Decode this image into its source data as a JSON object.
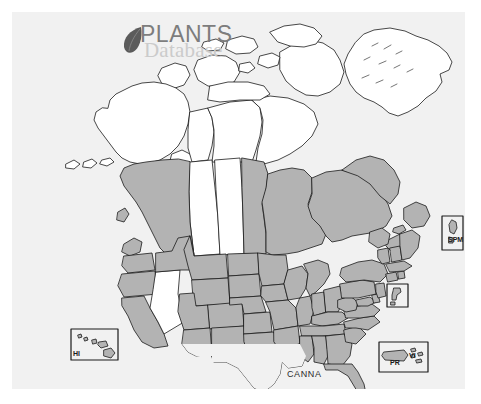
{
  "image": {
    "type": "distribution-map",
    "subject": "CANNA",
    "region": "North America (United States, Canada, Greenland) with insets",
    "width": 481,
    "height": 404
  },
  "watermark": {
    "line1": "PLANTS",
    "line2": "Database",
    "icon": "leaf-icon",
    "line1_color": "#7d7d7d",
    "line2_color": "#cbcbcb"
  },
  "map": {
    "background_color": "#f1f1f1",
    "page_background_color": "#ffffff",
    "shaded_fill": "#b3b3b3",
    "unshaded_fill": "#ffffff",
    "border_color": "#1a1a1a",
    "taxon_label": "CANNA"
  },
  "legend_shading": {
    "shaded_meaning": "present",
    "unshaded_meaning": "absent"
  },
  "insets": [
    {
      "id": "hi",
      "label": "HI",
      "name": "Hawaii",
      "shaded": true
    },
    {
      "id": "pr",
      "label": "PR",
      "name": "Puerto Rico",
      "shaded": true
    },
    {
      "id": "vi",
      "label": "VI",
      "name": "Virgin Islands",
      "shaded": true
    },
    {
      "id": "spm",
      "label": "SPM",
      "name": "Saint Pierre and Miquelon",
      "shaded": true
    },
    {
      "id": "bermuda",
      "label": "",
      "name": "island inset",
      "shaded": true
    }
  ],
  "shaded_regions": [
    "California",
    "Oregon",
    "Washington",
    "Idaho",
    "Montana",
    "Wyoming",
    "Utah",
    "Arizona",
    "Colorado",
    "New Mexico",
    "North Dakota",
    "South Dakota",
    "Nebraska",
    "Kansas",
    "Oklahoma",
    "Texas",
    "Minnesota",
    "Iowa",
    "Missouri",
    "Arkansas",
    "Louisiana",
    "Wisconsin",
    "Illinois",
    "Michigan",
    "Indiana",
    "Ohio",
    "Kentucky",
    "Tennessee",
    "Mississippi",
    "Alabama",
    "Georgia",
    "Florida",
    "South Carolina",
    "North Carolina",
    "Virginia",
    "West Virginia",
    "Maryland",
    "Delaware",
    "Pennsylvania",
    "New Jersey",
    "New York",
    "Connecticut",
    "Rhode Island",
    "Massachusetts",
    "Vermont",
    "New Hampshire",
    "Maine",
    "Manitoba",
    "Ontario",
    "Quebec",
    "New Brunswick",
    "Nova Scotia",
    "Prince Edward Island",
    "Newfoundland and Labrador",
    "British Columbia",
    "Hawaii",
    "Puerto Rico",
    "Virgin Islands",
    "Saint Pierre and Miquelon"
  ],
  "unshaded_regions": [
    "Alaska",
    "Nevada",
    "Alberta",
    "Saskatchewan",
    "Yukon",
    "Northwest Territories",
    "Nunavut",
    "Greenland"
  ]
}
